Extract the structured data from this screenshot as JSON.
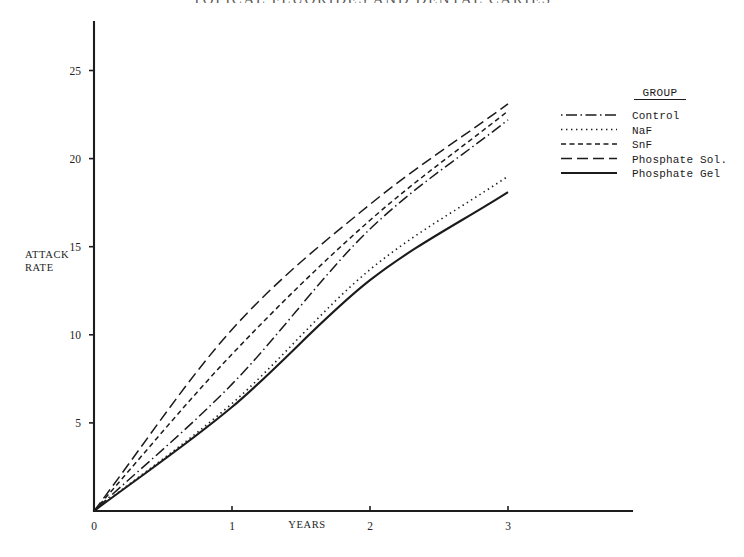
{
  "chart_data": {
    "type": "line",
    "title": "TOPICAL FLUORIDES AND DENTAL CARIES",
    "xlabel": "YEARS",
    "ylabel": "ATTACK RATE",
    "ylabel_line1": "ATTACK",
    "ylabel_line2": "RATE",
    "xlim": [
      0,
      3.85
    ],
    "ylim": [
      0,
      26.4
    ],
    "xticks": [
      0,
      1,
      2,
      3
    ],
    "xticklabels": [
      "0",
      "1",
      "2",
      "3"
    ],
    "yticks": [
      5,
      10,
      15,
      20,
      25
    ],
    "yticklabels": [
      "5",
      "10",
      "15",
      "20",
      "25"
    ],
    "grid": false,
    "legend_title": "GROUP",
    "legend_position": "right",
    "x": [
      0,
      1,
      2,
      3
    ],
    "series": [
      {
        "name": "Control",
        "label": "Control",
        "style": "dash-dot",
        "dasharray": "1.5,3.5,11,3.5",
        "width": 1.5,
        "values": [
          0,
          7.2,
          16.0,
          22.2
        ]
      },
      {
        "name": "NaF",
        "label": "NaF",
        "style": "dotted",
        "dasharray": "1.4,3.6",
        "width": 1.6,
        "values": [
          0,
          6.1,
          13.7,
          19.0
        ]
      },
      {
        "name": "SnF",
        "label": "SnF",
        "style": "short-dash",
        "dasharray": "5,3.5",
        "width": 1.5,
        "values": [
          0,
          8.9,
          16.5,
          22.7
        ]
      },
      {
        "name": "Phosphate Sol.",
        "label": "Phosphate Sol.",
        "style": "long-dash",
        "dasharray": "11,5",
        "width": 1.5,
        "values": [
          0,
          10.3,
          17.4,
          23.1
        ]
      },
      {
        "name": "Phosphate Gel",
        "label": "Phosphate Gel",
        "style": "solid",
        "dasharray": "none",
        "width": 2.1,
        "values": [
          0,
          5.9,
          13.1,
          18.1
        ]
      }
    ]
  },
  "colors": {
    "ink": "#1b1b1b",
    "background": "#ffffff",
    "title": "#5b5b5b"
  }
}
